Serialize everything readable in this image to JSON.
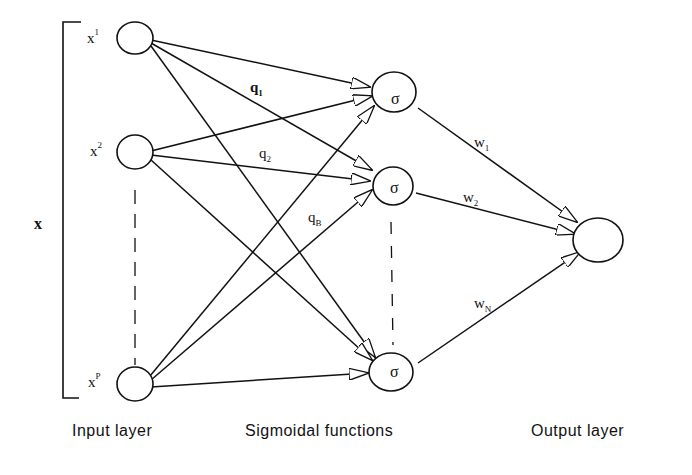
{
  "diagram": {
    "title": "",
    "vector_label": "x",
    "inputs": [
      {
        "base": "x",
        "sup": "1"
      },
      {
        "base": "x",
        "sup": "2"
      },
      {
        "base": "x",
        "sup": "P"
      }
    ],
    "hidden_nodes": [
      {
        "symbol": "σ"
      },
      {
        "symbol": "σ"
      },
      {
        "symbol": "σ"
      }
    ],
    "input_weights": [
      {
        "base": "q",
        "sub": "1"
      },
      {
        "base": "q",
        "sub": "2"
      },
      {
        "base": "q",
        "sub": "B"
      }
    ],
    "output_weights": [
      {
        "base": "w",
        "sub": "1"
      },
      {
        "base": "w",
        "sub": "2"
      },
      {
        "base": "w",
        "sub": "N"
      }
    ],
    "layer_captions": {
      "input": "Input layer",
      "hidden": "Sigmoidal functions",
      "output": "Output layer"
    },
    "colors": {
      "stroke": "#111111",
      "background": "#ffffff"
    }
  }
}
